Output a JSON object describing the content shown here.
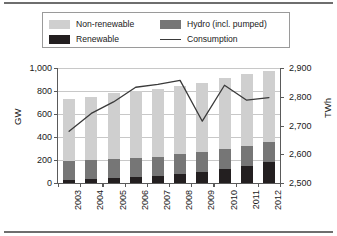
{
  "chart_data": {
    "type": "bar",
    "subtype": "stacked-bar-with-line",
    "title": "",
    "xlabel": "",
    "ylabel": "GW",
    "y2label": "TWh",
    "grid": true,
    "legend_position": "top",
    "categories": [
      "2003",
      "2004",
      "2005",
      "2006",
      "2007",
      "2008",
      "2009",
      "2010",
      "2011",
      "2012"
    ],
    "ylim": [
      0,
      1000
    ],
    "yticks": [
      0,
      200,
      400,
      600,
      800,
      1000
    ],
    "ytick_labels": [
      "0",
      "200",
      "400",
      "600",
      "800",
      "1,000"
    ],
    "y2lim": [
      2500,
      2900
    ],
    "y2ticks": [
      2500,
      2600,
      2700,
      2800,
      2900
    ],
    "y2tick_labels": [
      "2,500",
      "2,600",
      "2,700",
      "2,800",
      "2,900"
    ],
    "series": [
      {
        "name": "Renewable",
        "kind": "bar",
        "color": "#231f20",
        "unit": "GW",
        "axis": "left",
        "values": [
          30,
          38,
          42,
          48,
          60,
          78,
          98,
          122,
          152,
          186
        ]
      },
      {
        "name": "Hydro (incl. pumped)",
        "kind": "bar",
        "color": "#767676",
        "unit": "GW",
        "axis": "left",
        "values": [
          160,
          162,
          168,
          166,
          170,
          170,
          172,
          172,
          172,
          174
        ]
      },
      {
        "name": "Non-renewable",
        "kind": "bar",
        "color": "#cfcfcf",
        "unit": "GW",
        "axis": "left",
        "values": [
          540,
          548,
          570,
          588,
          585,
          596,
          600,
          618,
          624,
          614
        ]
      },
      {
        "name": "Consumption",
        "kind": "line",
        "color": "#3a3a3a",
        "unit": "TWh",
        "axis": "right",
        "values": [
          2680,
          2742,
          2782,
          2833,
          2843,
          2857,
          2715,
          2840,
          2788,
          2797
        ]
      }
    ],
    "bar_totals": [
      730,
      748,
      780,
      802,
      815,
      844,
      870,
      912,
      948,
      974
    ]
  },
  "legend": {
    "entries": [
      {
        "label": "Non-renewable",
        "marker": "swatch",
        "color": "#cfcfcf"
      },
      {
        "label": "Hydro (incl. pumped)",
        "marker": "swatch",
        "color": "#767676"
      },
      {
        "label": "Renewable",
        "marker": "swatch",
        "color": "#231f20"
      },
      {
        "label": "Consumption",
        "marker": "line",
        "color": "#3a3a3a"
      }
    ]
  },
  "axes": {
    "left_title": "GW",
    "right_title": "TWh"
  }
}
